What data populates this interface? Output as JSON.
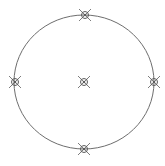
{
  "diagram": {
    "background": "#ffffff",
    "stroke_color": "#6e6e6e",
    "marker_color": "#5a5a5a",
    "ellipse": {
      "cx": 84,
      "cy": 82,
      "rx": 70,
      "ry": 67
    },
    "markers": [
      {
        "id": "top",
        "x": 85,
        "y": 15,
        "icon": "crosshair-marker-icon"
      },
      {
        "id": "left",
        "x": 15,
        "y": 82,
        "icon": "crosshair-marker-icon"
      },
      {
        "id": "center",
        "x": 84,
        "y": 82,
        "icon": "crosshair-marker-icon"
      },
      {
        "id": "right",
        "x": 154,
        "y": 82,
        "icon": "crosshair-marker-icon"
      },
      {
        "id": "bottom",
        "x": 84,
        "y": 149,
        "icon": "crosshair-marker-icon"
      }
    ]
  }
}
